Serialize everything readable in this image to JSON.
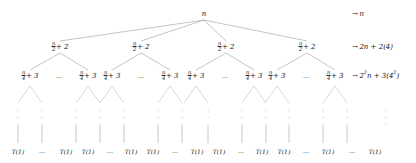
{
  "diagram": {
    "type": "recursion-tree",
    "background_color": "#ffffff",
    "line_color": "#8a8a8a",
    "text_color": "#111111",
    "ellipsis_horizontal": "⋯",
    "ellipsis_dot": "⋮",
    "arrow_glyph": "→"
  },
  "levels": [
    {
      "index": 0,
      "node_label_parts": {
        "numerator": "",
        "denominator": "",
        "rest": "n"
      },
      "node_plain": "n",
      "cost_label": "→ n",
      "cost_parts": {
        "arrow": "→",
        "coefficient": "",
        "term": "n",
        "extra": ""
      },
      "y": 14,
      "nodes_x": [
        204
      ]
    },
    {
      "index": 1,
      "node_label_parts": {
        "numerator": "n",
        "denominator": "2",
        "rest": "+ 2"
      },
      "node_plain": "n/2 + 2",
      "cost_label": "→ 2n + 2(4)",
      "cost_parts": {
        "arrow": "→",
        "coefficient": "2",
        "term": "n",
        "extra": "+ 2(4)"
      },
      "y": 47,
      "nodes_x": [
        60,
        141,
        226,
        307
      ]
    },
    {
      "index": 2,
      "node_label_parts": {
        "numerator": "n",
        "denominator": "4",
        "rest": "+ 3"
      },
      "node_plain": "n/4 + 3",
      "cost_label": "→ 2²n + 3(4²)",
      "cost_parts": {
        "arrow": "→",
        "coefficient": "2",
        "exponent": "2",
        "term": "n",
        "extra": "+ 3(4",
        "extra_exponent": "2",
        "extra_close": ")"
      },
      "y": 76,
      "nodes_x": [
        30,
        88,
        112,
        170,
        196,
        254,
        277,
        335
      ]
    }
  ],
  "row_labels": [
    {
      "text": "→ n",
      "y": 14,
      "x": 352
    },
    {
      "text": "→ 2n + 2(4)",
      "y": 47,
      "x": 352
    },
    {
      "text": "→ 2²n + 3(4²)",
      "y": 76,
      "x": 352
    }
  ],
  "level_separators": [
    {
      "level": 2,
      "x": 59,
      "y": 76,
      "glyph": "⋯"
    },
    {
      "level": 2,
      "x": 141,
      "y": 76,
      "glyph": "⋯"
    },
    {
      "level": 2,
      "x": 225,
      "y": 76,
      "glyph": "⋯"
    },
    {
      "level": 2,
      "x": 306,
      "y": 76,
      "glyph": "⋯"
    }
  ],
  "subtree_wedges": [
    {
      "apex_x": 30,
      "apex_y": 86,
      "left_x": 18,
      "right_x": 42,
      "base_y": 103
    },
    {
      "apex_x": 88,
      "apex_y": 86,
      "left_x": 76,
      "right_x": 100,
      "base_y": 103
    },
    {
      "apex_x": 112,
      "apex_y": 86,
      "left_x": 100,
      "right_x": 124,
      "base_y": 103
    },
    {
      "apex_x": 170,
      "apex_y": 86,
      "left_x": 158,
      "right_x": 182,
      "base_y": 103
    },
    {
      "apex_x": 196,
      "apex_y": 86,
      "left_x": 184,
      "right_x": 208,
      "base_y": 103
    },
    {
      "apex_x": 254,
      "apex_y": 86,
      "left_x": 242,
      "right_x": 266,
      "base_y": 103
    },
    {
      "apex_x": 277,
      "apex_y": 86,
      "left_x": 265,
      "right_x": 289,
      "base_y": 103
    },
    {
      "apex_x": 335,
      "apex_y": 86,
      "left_x": 323,
      "right_x": 347,
      "base_y": 103
    }
  ],
  "vertical_dots": [
    {
      "x": 18,
      "y": 116
    },
    {
      "x": 42,
      "y": 116
    },
    {
      "x": 76,
      "y": 116
    },
    {
      "x": 100,
      "y": 116
    },
    {
      "x": 100,
      "y": 116
    },
    {
      "x": 124,
      "y": 116
    },
    {
      "x": 158,
      "y": 116
    },
    {
      "x": 182,
      "y": 116
    },
    {
      "x": 184,
      "y": 116
    },
    {
      "x": 208,
      "y": 116
    },
    {
      "x": 242,
      "y": 116
    },
    {
      "x": 266,
      "y": 116
    },
    {
      "x": 265,
      "y": 116
    },
    {
      "x": 289,
      "y": 116
    },
    {
      "x": 323,
      "y": 116
    },
    {
      "x": 347,
      "y": 116
    },
    {
      "x": 386,
      "y": 116
    }
  ],
  "leaf_stems": [
    {
      "x": 18,
      "y_top": 124,
      "y_bottom": 141
    },
    {
      "x": 42,
      "y_top": 124,
      "y_bottom": 141
    },
    {
      "x": 76,
      "y_top": 124,
      "y_bottom": 141
    },
    {
      "x": 100,
      "y_top": 124,
      "y_bottom": 141
    },
    {
      "x": 124,
      "y_top": 124,
      "y_bottom": 141
    },
    {
      "x": 158,
      "y_top": 124,
      "y_bottom": 141
    },
    {
      "x": 182,
      "y_top": 124,
      "y_bottom": 141
    },
    {
      "x": 208,
      "y_top": 124,
      "y_bottom": 141
    },
    {
      "x": 242,
      "y_top": 124,
      "y_bottom": 141
    },
    {
      "x": 266,
      "y_top": 124,
      "y_bottom": 141
    },
    {
      "x": 289,
      "y_top": 124,
      "y_bottom": 141
    },
    {
      "x": 323,
      "y_top": 124,
      "y_bottom": 141
    },
    {
      "x": 347,
      "y_top": 124,
      "y_bottom": 141
    }
  ],
  "leaves": {
    "label": "T(1)",
    "y": 152,
    "items": [
      {
        "text": "T(1)",
        "x": 18
      },
      {
        "text": "⋯",
        "x": 42,
        "is_ellipsis": true
      },
      {
        "text": "T(1)",
        "x": 66
      },
      {
        "text": "T(1)",
        "x": 88
      },
      {
        "text": "⋯",
        "x": 110,
        "is_ellipsis": true
      },
      {
        "text": "T(1)",
        "x": 131
      },
      {
        "text": "T(1)",
        "x": 153
      },
      {
        "text": "⋯",
        "x": 175,
        "is_ellipsis": true
      },
      {
        "text": "T(1)",
        "x": 197
      },
      {
        "text": "T(1)",
        "x": 219
      },
      {
        "text": "⋯",
        "x": 241,
        "is_ellipsis": true
      },
      {
        "text": "T(1)",
        "x": 262
      },
      {
        "text": "T(1)",
        "x": 284
      },
      {
        "text": "⋯",
        "x": 306,
        "is_ellipsis": true
      },
      {
        "text": "T(1)",
        "x": 328
      },
      {
        "text": "T(1)",
        "x": 350,
        "hidden": true
      },
      {
        "text": "⋯",
        "x": 300,
        "hidden": true
      },
      {
        "text": "T(1)",
        "x": 375
      }
    ]
  }
}
